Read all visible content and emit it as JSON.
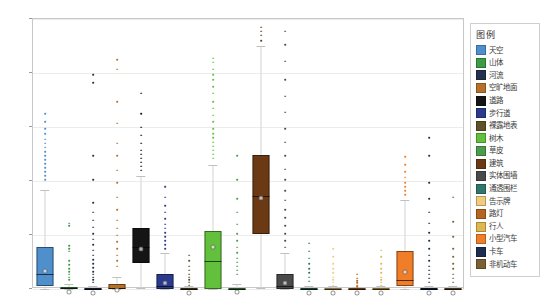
{
  "chart_data": {
    "type": "box",
    "title": "",
    "xlabel": "",
    "ylabel": "",
    "ylim": [
      0,
      1
    ],
    "ytick_labels": [
      "0",
      "0.2",
      "0.4",
      "0.6",
      "0.8",
      "1"
    ],
    "ytick_values": [
      0,
      0.2,
      0.4,
      0.6,
      0.8,
      1
    ],
    "grid": true,
    "legend_position": "right-outside",
    "categories": [
      "天空",
      "山体",
      "河流",
      "空旷地面",
      "道路",
      "步行道",
      "裸露地表",
      "树木",
      "草皮",
      "建筑",
      "实体围墙",
      "通透围栏",
      "告示牌",
      "路灯",
      "行人",
      "小型汽车",
      "卡车",
      "非机动车"
    ],
    "series": [
      {
        "name": "天空",
        "color": "#4f8fcc",
        "q1": 0.012,
        "median": 0.055,
        "q3": 0.155,
        "mean": 0.085,
        "whisker_low": 0.0,
        "whisker_high": 0.365,
        "fliers": [
          0.41,
          0.425,
          0.44,
          0.455,
          0.47,
          0.485,
          0.5,
          0.515,
          0.53,
          0.545,
          0.56,
          0.58,
          0.6,
          0.625,
          0.655
        ]
      },
      {
        "name": "山体",
        "color": "#3c9b45",
        "q1": 0.0,
        "median": 0.002,
        "q3": 0.008,
        "mean": 0.006,
        "whisker_low": 0.0,
        "whisker_high": 0.02,
        "fliers": [
          0.04,
          0.05,
          0.06,
          0.07,
          0.08,
          0.095,
          0.11,
          0.145,
          0.155,
          0.165,
          0.24,
          0.25
        ]
      },
      {
        "name": "河流",
        "color": "#25304d",
        "q1": 0.0,
        "median": 0.0,
        "q3": 0.004,
        "mean": 0.004,
        "whisker_low": 0.0,
        "whisker_high": 0.012,
        "fliers": [
          0.03,
          0.04,
          0.05,
          0.06,
          0.07,
          0.085,
          0.1,
          0.115,
          0.13,
          0.15,
          0.17,
          0.19,
          0.21,
          0.235,
          0.26,
          0.29,
          0.325,
          0.41,
          0.5,
          0.77,
          0.8
        ]
      },
      {
        "name": "空旷地面",
        "color": "#b5712a",
        "q1": 0.0,
        "median": 0.003,
        "q3": 0.018,
        "mean": 0.015,
        "whisker_low": 0.0,
        "whisker_high": 0.045,
        "fliers": [
          0.09,
          0.11,
          0.13,
          0.155,
          0.18,
          0.205,
          0.23,
          0.26,
          0.3,
          0.345,
          0.4,
          0.445,
          0.5,
          0.545,
          0.62,
          0.7,
          0.82,
          0.855
        ]
      },
      {
        "name": "道路",
        "color": "#151515",
        "q1": 0.095,
        "median": 0.155,
        "q3": 0.225,
        "mean": 0.165,
        "whisker_low": 0.005,
        "whisker_high": 0.42,
        "fliers": [
          0.445,
          0.46,
          0.475,
          0.49,
          0.505,
          0.52,
          0.545,
          0.575,
          0.605,
          0.655,
          0.73
        ]
      },
      {
        "name": "步行道",
        "color": "#2b3a8c",
        "q1": 0.0,
        "median": 0.012,
        "q3": 0.055,
        "mean": 0.04,
        "whisker_low": 0.0,
        "whisker_high": 0.135,
        "fliers": [
          0.155,
          0.17,
          0.185,
          0.2,
          0.215,
          0.23,
          0.245,
          0.265,
          0.29,
          0.315,
          0.345,
          0.385
        ]
      },
      {
        "name": "裸露地表",
        "color": "#5d5228",
        "q1": 0.0,
        "median": 0.0,
        "q3": 0.004,
        "mean": 0.004,
        "whisker_low": 0.0,
        "whisker_high": 0.012,
        "fliers": [
          0.02,
          0.03,
          0.04,
          0.05,
          0.06,
          0.075,
          0.09,
          0.11,
          0.13
        ]
      },
      {
        "name": "树木",
        "color": "#62c03c",
        "q1": 0.0,
        "median": 0.105,
        "q3": 0.215,
        "mean": 0.175,
        "whisker_low": 0.0,
        "whisker_high": 0.46,
        "fliers": [
          0.49,
          0.505,
          0.52,
          0.535,
          0.55,
          0.565,
          0.58,
          0.6,
          0.625,
          0.65,
          0.675,
          0.7,
          0.73,
          0.755,
          0.78,
          0.8,
          0.82,
          0.845,
          0.86
        ]
      },
      {
        "name": "草皮",
        "color": "#4d9b4d",
        "q1": 0.0,
        "median": 0.0,
        "q3": 0.005,
        "mean": 0.006,
        "whisker_low": 0.0,
        "whisker_high": 0.02,
        "fliers": [
          0.06,
          0.075,
          0.09,
          0.105,
          0.12,
          0.14,
          0.16,
          0.185,
          0.21,
          0.245,
          0.29,
          0.34,
          0.41,
          0.5
        ]
      },
      {
        "name": "建筑",
        "color": "#6b3a15",
        "q1": 0.205,
        "median": 0.345,
        "q3": 0.495,
        "mean": 0.355,
        "whisker_low": 0.005,
        "whisker_high": 0.9,
        "fliers": [
          0.925,
          0.945,
          0.96,
          0.975
        ]
      },
      {
        "name": "实体围墙",
        "color": "#4a4a4a",
        "q1": 0.0,
        "median": 0.012,
        "q3": 0.055,
        "mean": 0.04,
        "whisker_low": 0.0,
        "whisker_high": 0.135,
        "fliers": [
          0.16,
          0.185,
          0.21,
          0.24,
          0.27,
          0.3,
          0.335,
          0.37,
          0.41,
          0.45,
          0.5,
          0.55,
          0.6,
          0.66,
          0.72,
          0.78,
          0.85,
          0.91,
          0.96
        ]
      },
      {
        "name": "通透围栏",
        "color": "#2f7768",
        "q1": 0.0,
        "median": 0.0,
        "q3": 0.004,
        "mean": 0.004,
        "whisker_low": 0.0,
        "whisker_high": 0.012,
        "fliers": [
          0.035,
          0.05,
          0.065,
          0.08,
          0.1,
          0.12,
          0.145,
          0.175
        ]
      },
      {
        "name": "告示牌",
        "color": "#f2cc7e",
        "q1": 0.0,
        "median": 0.0,
        "q3": 0.003,
        "mean": 0.003,
        "whisker_low": 0.0,
        "whisker_high": 0.01,
        "fliers": [
          0.02,
          0.03,
          0.04,
          0.05,
          0.065,
          0.08,
          0.1,
          0.125,
          0.155
        ]
      },
      {
        "name": "路灯",
        "color": "#b5651f",
        "q1": 0.0,
        "median": 0.0,
        "q3": 0.002,
        "mean": 0.002,
        "whisker_low": 0.0,
        "whisker_high": 0.008,
        "fliers": [
          0.015,
          0.02,
          0.028,
          0.036,
          0.045,
          0.06
        ]
      },
      {
        "name": "行人",
        "color": "#e0b74e",
        "q1": 0.0,
        "median": 0.0,
        "q3": 0.003,
        "mean": 0.003,
        "whisker_low": 0.0,
        "whisker_high": 0.01,
        "fliers": [
          0.02,
          0.03,
          0.04,
          0.05,
          0.065,
          0.08,
          0.1,
          0.125,
          0.15
        ]
      },
      {
        "name": "小型汽车",
        "color": "#f07d28",
        "q1": 0.01,
        "median": 0.035,
        "q3": 0.14,
        "mean": 0.08,
        "whisker_low": 0.0,
        "whisker_high": 0.33,
        "fliers": [
          0.355,
          0.37,
          0.385,
          0.4,
          0.42,
          0.44,
          0.465,
          0.495
        ]
      },
      {
        "name": "卡车",
        "color": "#1d2c4f",
        "q1": 0.0,
        "median": 0.0,
        "q3": 0.004,
        "mean": 0.004,
        "whisker_low": 0.0,
        "whisker_high": 0.012,
        "fliers": [
          0.03,
          0.045,
          0.06,
          0.075,
          0.09,
          0.11,
          0.13,
          0.155,
          0.185,
          0.215,
          0.25,
          0.29,
          0.34,
          0.4,
          0.5,
          0.565
        ]
      },
      {
        "name": "非机动车",
        "color": "#7a6032",
        "q1": 0.0,
        "median": 0.0,
        "q3": 0.003,
        "mean": 0.003,
        "whisker_low": 0.0,
        "whisker_high": 0.01,
        "fliers": [
          0.03,
          0.045,
          0.06,
          0.08,
          0.1,
          0.125,
          0.155,
          0.2,
          0.255,
          0.345
        ]
      }
    ]
  },
  "legend": {
    "title": "图例",
    "items": [
      {
        "label": "天空",
        "color": "#4f8fcc"
      },
      {
        "label": "山体",
        "color": "#3c9b45"
      },
      {
        "label": "河流",
        "color": "#25304d"
      },
      {
        "label": "空旷地面",
        "color": "#b5712a"
      },
      {
        "label": "道路",
        "color": "#151515"
      },
      {
        "label": "步行道",
        "color": "#2b3a8c"
      },
      {
        "label": "裸露地表",
        "color": "#5d5228"
      },
      {
        "label": "树木",
        "color": "#62c03c"
      },
      {
        "label": "草皮",
        "color": "#4d9b4d"
      },
      {
        "label": "建筑",
        "color": "#6b3a15"
      },
      {
        "label": "实体围墙",
        "color": "#4a4a4a"
      },
      {
        "label": "通透围栏",
        "color": "#2f7768"
      },
      {
        "label": "告示牌",
        "color": "#f2cc7e"
      },
      {
        "label": "路灯",
        "color": "#b5651f"
      },
      {
        "label": "行人",
        "color": "#e0b74e"
      },
      {
        "label": "小型汽车",
        "color": "#f07d28"
      },
      {
        "label": "卡车",
        "color": "#1d2c4f"
      },
      {
        "label": "非机动车",
        "color": "#7a6032"
      }
    ]
  }
}
